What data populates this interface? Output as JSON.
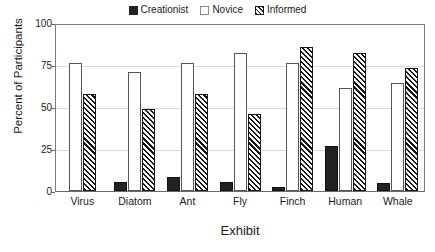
{
  "chart_data": {
    "type": "bar",
    "title": "",
    "xlabel": "Exhibit",
    "ylabel": "Percent of Participants",
    "ylim": [
      0,
      100
    ],
    "yticks": [
      0,
      25,
      50,
      75,
      100
    ],
    "ytick_labels": [
      "0",
      "25",
      "50",
      "75",
      "100"
    ],
    "grid": true,
    "legend_position": "top-center",
    "categories": [
      "Virus",
      "Diatom",
      "Ant",
      "Fly",
      "Finch",
      "Human",
      "Whale"
    ],
    "series": [
      {
        "name": "Creationist",
        "marker": "solid-black-square",
        "color": "#222222",
        "values": [
          0,
          5.5,
          8.5,
          5.5,
          2.5,
          27,
          5
        ]
      },
      {
        "name": "Novice",
        "marker": "open-white-square",
        "color": "#ffffff",
        "values": [
          77,
          71.5,
          77,
          83,
          77,
          62,
          65
        ]
      },
      {
        "name": "Informed",
        "marker": "hatched-square",
        "color": "#161616",
        "values": [
          58.5,
          49.5,
          58.5,
          46.5,
          87,
          83,
          74
        ]
      }
    ]
  },
  "legend": {
    "entries": [
      {
        "label": "Creationist"
      },
      {
        "label": "Novice"
      },
      {
        "label": "Informed"
      }
    ]
  },
  "axes": {
    "y_title": "Percent of Participants",
    "x_title": "Exhibit",
    "y_labels": [
      "100",
      "75",
      "50",
      "25",
      "0"
    ]
  },
  "colors": {
    "axis": "#6a6a6a",
    "grid": "#d8d8d8",
    "text": "#1a1a1a",
    "creationist": "#222222",
    "novice": "#ffffff",
    "informed": "#161616"
  }
}
